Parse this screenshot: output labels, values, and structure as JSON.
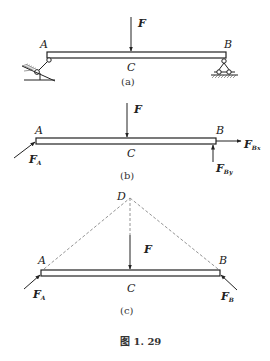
{
  "figure": {
    "caption": "图 1. 29",
    "panels": [
      {
        "id": "a",
        "caption": "(a)",
        "labels": {
          "left": "A",
          "right": "B",
          "middle": "C",
          "force": "F"
        },
        "supports": {
          "left": "pinned-link on inclined surface",
          "right": "roller support"
        }
      },
      {
        "id": "b",
        "caption": "(b)",
        "labels": {
          "left": "A",
          "right": "B",
          "middle": "C",
          "force": "F"
        },
        "forces": [
          {
            "name": "F",
            "sub": "",
            "direction": "down at C"
          },
          {
            "name": "F",
            "sub": "A",
            "direction": "inclined into A"
          },
          {
            "name": "F",
            "sub": "Bx",
            "direction": "horizontal right at B"
          },
          {
            "name": "F",
            "sub": "By",
            "direction": "upward at B"
          }
        ]
      },
      {
        "id": "c",
        "caption": "(c)",
        "labels": {
          "left": "A",
          "right": "B",
          "middle": "C",
          "apex": "D",
          "force": "F"
        },
        "forces": [
          {
            "name": "F",
            "sub": "",
            "direction": "down at C"
          },
          {
            "name": "F",
            "sub": "A",
            "direction": "along AD toward A"
          },
          {
            "name": "F",
            "sub": "B",
            "direction": "along BD toward B"
          }
        ]
      }
    ]
  }
}
